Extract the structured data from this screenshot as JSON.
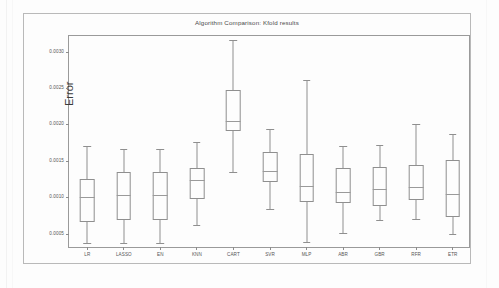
{
  "figure": {
    "title": "Algorithm Comparison: Kfold results",
    "ylabel": "Error"
  },
  "chart_data": {
    "type": "box",
    "title": "Algorithm Comparison: Kfold results",
    "xlabel": "",
    "ylabel": "Error",
    "ylim": [
      0.0003,
      0.00322
    ],
    "grid": false,
    "legend": null,
    "ytick_labels": [
      "0.0005",
      "0.0010",
      "0.0015",
      "0.0020",
      "0.0025",
      "0.0030"
    ],
    "ytick_values": [
      0.0005,
      0.001,
      0.0015,
      0.002,
      0.0025,
      0.003
    ],
    "categories": [
      "LR",
      "LASSO",
      "EN",
      "KNN",
      "CART",
      "SVR",
      "MLP",
      "ABR",
      "GBR",
      "RFR",
      "ETR"
    ],
    "boxes": [
      {
        "label": "LR",
        "whisker_low": 0.000385,
        "q1": 0.000665,
        "median": 0.00101,
        "q3": 0.001255,
        "whisker_high": 0.001715
      },
      {
        "label": "LASSO",
        "whisker_low": 0.000383,
        "q1": 0.0007,
        "median": 0.00104,
        "q3": 0.001355,
        "whisker_high": 0.001665
      },
      {
        "label": "EN",
        "whisker_low": 0.00038,
        "q1": 0.000698,
        "median": 0.00104,
        "q3": 0.00135,
        "whisker_high": 0.001665
      },
      {
        "label": "KNN",
        "whisker_low": 0.000635,
        "q1": 0.000985,
        "median": 0.00125,
        "q3": 0.00141,
        "whisker_high": 0.00177
      },
      {
        "label": "CART",
        "whisker_low": 0.00136,
        "q1": 0.001915,
        "median": 0.00206,
        "q3": 0.002485,
        "whisker_high": 0.003165
      },
      {
        "label": "SVR",
        "whisker_low": 0.000855,
        "q1": 0.00122,
        "median": 0.001375,
        "q3": 0.001635,
        "whisker_high": 0.001945
      },
      {
        "label": "MLP",
        "whisker_low": 0.00039,
        "q1": 0.00094,
        "median": 0.00116,
        "q3": 0.0016,
        "whisker_high": 0.00262
      },
      {
        "label": "ABR",
        "whisker_low": 0.00052,
        "q1": 0.000935,
        "median": 0.001085,
        "q3": 0.001405,
        "whisker_high": 0.00171
      },
      {
        "label": "GBR",
        "whisker_low": 0.000695,
        "q1": 0.00089,
        "median": 0.001125,
        "q3": 0.001425,
        "whisker_high": 0.001725
      },
      {
        "label": "RFR",
        "whisker_low": 0.00071,
        "q1": 0.000965,
        "median": 0.001155,
        "q3": 0.00145,
        "whisker_high": 0.00201
      },
      {
        "label": "ETR",
        "whisker_low": 0.000505,
        "q1": 0.000745,
        "median": 0.00105,
        "q3": 0.00152,
        "whisker_high": 0.00188
      }
    ]
  }
}
